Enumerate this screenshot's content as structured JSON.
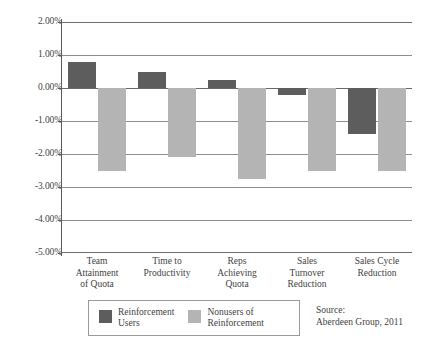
{
  "chart_data": {
    "type": "bar",
    "title": "",
    "subtitle": "",
    "xlabel": "",
    "ylabel": "",
    "ylim": [
      -5.0,
      2.0
    ],
    "ytick_labels": [
      "2.00%",
      "1.00%",
      "0.00%",
      "-1.00%",
      "-2.00%",
      "-3.00%",
      "-4.00%",
      "-5.00%"
    ],
    "ytick_values": [
      2.0,
      1.0,
      0.0,
      -1.0,
      -2.0,
      -3.0,
      -4.0,
      -5.0
    ],
    "grid": true,
    "legend_position": "bottom-left",
    "categories": [
      "Team\nAttainment\nof Quota",
      "Time to\nProductivity",
      "Reps\nAchieving\nQuota",
      "Sales\nTurnover\nReduction",
      "Sales Cycle\nReduction"
    ],
    "series": [
      {
        "name": "Reinforcement\nUsers",
        "color": "#5d5d5d",
        "values": [
          0.8,
          0.5,
          0.25,
          -0.2,
          -1.4
        ]
      },
      {
        "name": "Nonusers of\nReinforcement",
        "color": "#b4b4b4",
        "values": [
          -2.5,
          -2.1,
          -2.75,
          -2.5,
          -2.5
        ]
      }
    ],
    "annotations": {
      "source": "Source:\nAberdeen Group, 2011"
    }
  },
  "legend": {
    "entries": [
      {
        "label": "Reinforcement\nUsers",
        "swatch": "dark"
      },
      {
        "label": "Nonusers of\nReinforcement",
        "swatch": "light"
      }
    ]
  },
  "source": {
    "text": "Source:\nAberdeen Group, 2011"
  }
}
